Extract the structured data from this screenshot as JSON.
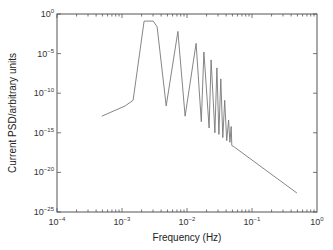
{
  "chart_data": {
    "type": "line",
    "title": "",
    "xlabel": "Frequency (Hz)",
    "ylabel": "Current PSD/arbitrary units",
    "xscale": "log",
    "yscale": "log",
    "xlim": [
      0.0001,
      1
    ],
    "ylim": [
      1e-25,
      1
    ],
    "grid": false,
    "legend": "none",
    "x_ticks": [
      {
        "base": "10",
        "exp": "−4",
        "value": 0.0001
      },
      {
        "base": "10",
        "exp": "−3",
        "value": 0.001
      },
      {
        "base": "10",
        "exp": "−2",
        "value": 0.01
      },
      {
        "base": "10",
        "exp": "−1",
        "value": 0.1
      },
      {
        "base": "10",
        "exp": "0",
        "value": 1
      }
    ],
    "y_ticks": [
      {
        "base": "10",
        "exp": "0",
        "value": 1
      },
      {
        "base": "10",
        "exp": "−5",
        "value": 1e-05
      },
      {
        "base": "10",
        "exp": "−10",
        "value": 1e-10
      },
      {
        "base": "10",
        "exp": "−15",
        "value": 1e-15
      },
      {
        "base": "10",
        "exp": "−20",
        "value": 1e-20
      },
      {
        "base": "10",
        "exp": "−25",
        "value": 1e-25
      }
    ],
    "series": [
      {
        "name": "Current PSD",
        "color": "#777777",
        "x_log10": [
          -3.31,
          -2.95,
          -2.83,
          -2.66,
          -2.52,
          -2.46,
          -2.32,
          -2.14,
          -2.03,
          -1.86,
          -1.78,
          -1.74,
          -1.66,
          -1.63,
          -1.57,
          -1.54,
          -1.51,
          -1.48,
          -1.45,
          -1.42,
          -1.39,
          -1.36,
          -1.34,
          -1.32,
          -1.31,
          -1.27,
          0.0,
          -0.31
        ],
        "y_log10": [
          -12.9,
          -11.6,
          -10.9,
          -0.9,
          -0.9,
          -1.6,
          -11.6,
          -2.2,
          -12.9,
          -3.7,
          -13.6,
          -4.8,
          -14.4,
          -5.8,
          -15.0,
          -6.8,
          -15.2,
          -8.2,
          -15.6,
          -10.9,
          -16.0,
          -13.4,
          -16.2,
          -14.2,
          -16.6,
          -16.8,
          -22.0,
          -22.6
        ]
      }
    ]
  }
}
